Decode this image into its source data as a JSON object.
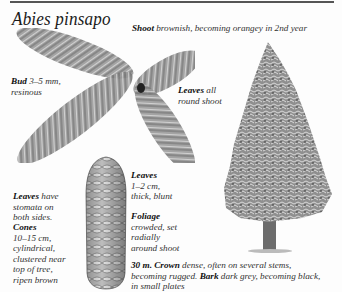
{
  "page": {
    "title": "Abies pinsapo"
  },
  "annotations": {
    "shoot": {
      "label": "Shoot",
      "text": " brownish, becoming orangey in 2nd year"
    },
    "bud": {
      "label": "Bud",
      "text_1": " 3–5 mm,",
      "text_2": "resinous"
    },
    "leaves_all": {
      "label": "Leaves",
      "text_1": " all",
      "text_2": "round shoot"
    },
    "leaves_size": {
      "label": "Leaves",
      "text_1": "1–2 cm,",
      "text_2": "thick, blunt"
    },
    "foliage": {
      "label": "Foliage",
      "text_1": "crowded, set",
      "text_2": "radially",
      "text_3": "around shoot"
    },
    "leaves_stomata": {
      "label": "Leaves",
      "text_1": " have",
      "text_2": "stomata on",
      "text_3": "both sides."
    },
    "cones": {
      "label": "Cones",
      "text_1": "10–15 cm,",
      "text_2": "cylindrical,",
      "text_3": "clustered near",
      "text_4": "top of tree,",
      "text_5": "ripen brown"
    },
    "crown": {
      "height": "30 m.",
      "crown_label": " Crown",
      "crown_text_1": " dense, often on several stems,",
      "crown_text_2": "becoming rugged. ",
      "bark_label": "Bark",
      "bark_text": " dark grey, becoming black,",
      "text_3": "in small plates"
    }
  },
  "illustrations": {
    "shoot": "shoot-illustration",
    "cone": "cone-illustration",
    "tree": "tree-illustration"
  }
}
